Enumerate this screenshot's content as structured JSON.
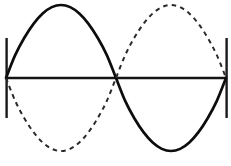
{
  "figure": {
    "background_color": "#ffffff",
    "width": 231,
    "height": 166,
    "axis": {
      "name": "horizontal-axis",
      "y": 78,
      "x_start": 6,
      "x_end": 226,
      "color": "#141414",
      "stroke_width": 2.6
    },
    "end_ticks": [
      {
        "label": "left-tick",
        "x": 6,
        "y_top": 38,
        "y_bottom": 118,
        "color": "#1a1a1a"
      },
      {
        "label": "right-tick",
        "x": 226,
        "y_top": 38,
        "y_bottom": 118,
        "color": "#1a1a1a"
      }
    ],
    "crossing_point": {
      "x": 117,
      "y": 78
    },
    "peaks": [
      {
        "curve": "solid",
        "x": 59,
        "y": 5,
        "direction": "up"
      },
      {
        "curve": "solid",
        "x": 172,
        "y": 157,
        "direction": "down"
      },
      {
        "curve": "dashed",
        "x": 59,
        "y": 158,
        "direction": "down"
      },
      {
        "curve": "dashed",
        "x": 172,
        "y": 5,
        "direction": "up"
      }
    ]
  },
  "chart_data": {
    "type": "line",
    "xlabel": "",
    "ylabel": "",
    "grid": false,
    "legend_position": "none",
    "xlim": [
      0,
      360
    ],
    "ylim": [
      -1,
      1
    ],
    "x_tick_labels": [],
    "y_tick_labels": [],
    "x_degrees": [
      0,
      15,
      30,
      45,
      60,
      75,
      90,
      105,
      120,
      135,
      150,
      165,
      180,
      195,
      210,
      225,
      240,
      255,
      270,
      285,
      300,
      315,
      330,
      345,
      360
    ],
    "series": [
      {
        "name": "solid-sine",
        "style": "solid",
        "color": "#0d0d0d",
        "phase_deg": 0,
        "amplitude": 1,
        "values": [
          0,
          0.259,
          0.5,
          0.707,
          0.866,
          0.966,
          1,
          0.966,
          0.866,
          0.707,
          0.5,
          0.259,
          0,
          -0.259,
          -0.5,
          -0.707,
          -0.866,
          -0.966,
          -1,
          -0.966,
          -0.866,
          -0.707,
          -0.5,
          -0.259,
          0
        ]
      },
      {
        "name": "dashed-sine",
        "style": "dashed",
        "color": "#2a2a2a",
        "phase_deg": 180,
        "amplitude": 1,
        "values": [
          0,
          -0.259,
          -0.5,
          -0.707,
          -0.866,
          -0.966,
          -1,
          -0.966,
          -0.866,
          -0.707,
          -0.5,
          -0.259,
          0,
          0.259,
          0.5,
          0.707,
          0.866,
          0.966,
          1,
          0.966,
          0.866,
          0.707,
          0.5,
          0.259,
          0
        ]
      }
    ]
  }
}
